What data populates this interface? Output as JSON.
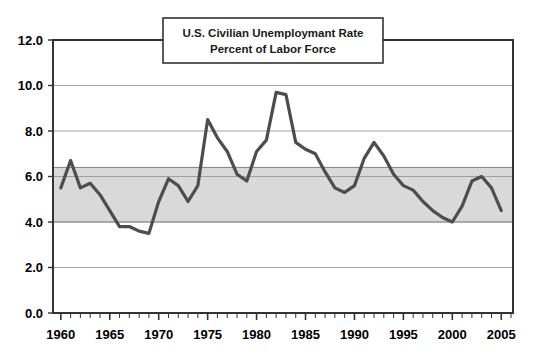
{
  "chart_data": {
    "type": "line",
    "title": "U.S. Civilian Unemploymant Rate",
    "subtitle": "Percent of Labor Force",
    "xlabel": "",
    "ylabel": "",
    "xlim": [
      1959.2,
      2006.2
    ],
    "ylim": [
      0.0,
      12.0
    ],
    "grid": true,
    "grid_axis": "y",
    "legend": "none",
    "y_ticks": [
      "0.0",
      "2.0",
      "4.0",
      "6.0",
      "8.0",
      "10.0",
      "12.0"
    ],
    "y_tick_values": [
      0.0,
      2.0,
      4.0,
      6.0,
      8.0,
      10.0,
      12.0
    ],
    "x_ticks": [
      "1960",
      "1965",
      "1970",
      "1975",
      "1980",
      "1985",
      "1990",
      "1995",
      "2000",
      "2005"
    ],
    "x_tick_values": [
      1960,
      1965,
      1970,
      1975,
      1980,
      1985,
      1990,
      1995,
      2000,
      2005
    ],
    "x_minor_tick_step": 1,
    "shaded_band": {
      "label": "",
      "y_min": 4.0,
      "y_max": 6.4,
      "fill_color": "#d9d9d9",
      "edge_color": "#808080"
    },
    "series": [
      {
        "name": "U.S. Civilian Unemployment Rate",
        "color": "#4d4d4d",
        "line_width": 3.2,
        "x": [
          1960,
          1961,
          1962,
          1963,
          1964,
          1965,
          1966,
          1967,
          1968,
          1969,
          1970,
          1971,
          1972,
          1973,
          1974,
          1975,
          1976,
          1977,
          1978,
          1979,
          1980,
          1981,
          1982,
          1983,
          1984,
          1985,
          1986,
          1987,
          1988,
          1989,
          1990,
          1991,
          1992,
          1993,
          1994,
          1995,
          1996,
          1997,
          1998,
          1999,
          2000,
          2001,
          2002,
          2003,
          2004,
          2005
        ],
        "values": [
          5.5,
          6.7,
          5.5,
          5.7,
          5.2,
          4.5,
          3.8,
          3.8,
          3.6,
          3.5,
          4.9,
          5.9,
          5.6,
          4.9,
          5.6,
          8.5,
          7.7,
          7.1,
          6.1,
          5.8,
          7.1,
          7.6,
          9.7,
          9.6,
          7.5,
          7.2,
          7.0,
          6.2,
          5.5,
          5.3,
          5.6,
          6.8,
          7.5,
          6.9,
          6.1,
          5.6,
          5.4,
          4.9,
          4.5,
          4.2,
          4.0,
          4.7,
          5.8,
          6.0,
          5.5,
          4.5
        ]
      }
    ]
  },
  "axes": {
    "frame_color": "#333333",
    "gridline_color": "#999999"
  }
}
